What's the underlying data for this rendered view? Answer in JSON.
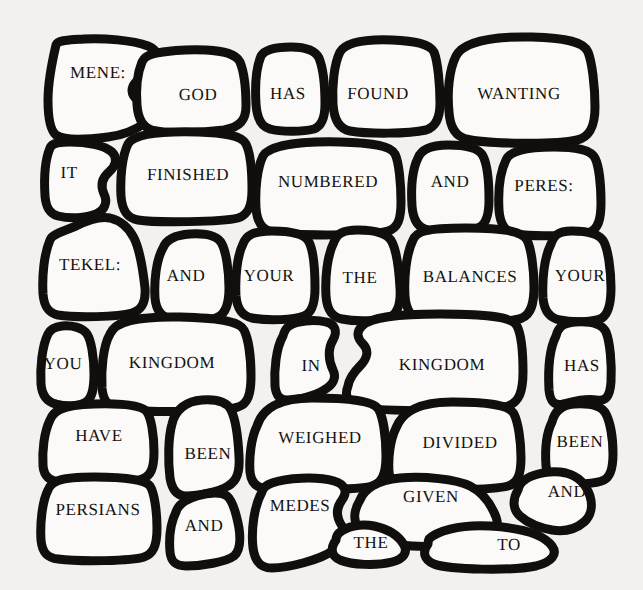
{
  "artwork": {
    "title": "Mene Mene Tekel Upharsin",
    "style": "hand-drawn crazy-paving stone wall",
    "background_color": "#f2f1ef",
    "stone_fill_color": "#fbfaf8",
    "mortar_color": "#100f0d",
    "text_color": "#14120f",
    "cell_count": 34
  },
  "cells": [
    {
      "id": "cell-mene",
      "text": "MENE:",
      "cx": 98,
      "cy": 72,
      "font_size": 17
    },
    {
      "id": "cell-god",
      "text": "GOD",
      "cx": 198,
      "cy": 94,
      "font_size": 17
    },
    {
      "id": "cell-has-1",
      "text": "HAS",
      "cx": 288,
      "cy": 93,
      "font_size": 17
    },
    {
      "id": "cell-found",
      "text": "FOUND",
      "cx": 378,
      "cy": 93,
      "font_size": 17
    },
    {
      "id": "cell-wanting",
      "text": "WANTING",
      "cx": 519,
      "cy": 93,
      "font_size": 17
    },
    {
      "id": "cell-it",
      "text": "IT",
      "cx": 69,
      "cy": 172,
      "font_size": 17
    },
    {
      "id": "cell-finished",
      "text": "FINISHED",
      "cx": 188,
      "cy": 174,
      "font_size": 17
    },
    {
      "id": "cell-numbered",
      "text": "NUMBERED",
      "cx": 328,
      "cy": 181,
      "font_size": 17
    },
    {
      "id": "cell-and-1",
      "text": "AND",
      "cx": 450,
      "cy": 181,
      "font_size": 17
    },
    {
      "id": "cell-peres",
      "text": "PERES:",
      "cx": 544,
      "cy": 185,
      "font_size": 17
    },
    {
      "id": "cell-tekel",
      "text": "TEKEL:",
      "cx": 90,
      "cy": 264,
      "font_size": 17
    },
    {
      "id": "cell-and-2",
      "text": "AND",
      "cx": 186,
      "cy": 275,
      "font_size": 17
    },
    {
      "id": "cell-your-1",
      "text": "YOUR",
      "cx": 269,
      "cy": 275,
      "font_size": 17
    },
    {
      "id": "cell-the-1",
      "text": "THE",
      "cx": 360,
      "cy": 277,
      "font_size": 17
    },
    {
      "id": "cell-balances",
      "text": "BALANCES",
      "cx": 470,
      "cy": 276,
      "font_size": 17
    },
    {
      "id": "cell-your-2",
      "text": "YOUR",
      "cx": 580,
      "cy": 275,
      "font_size": 17
    },
    {
      "id": "cell-you",
      "text": "YOU",
      "cx": 63,
      "cy": 363,
      "font_size": 17
    },
    {
      "id": "cell-kingdom-1",
      "text": "KINGDOM",
      "cx": 172,
      "cy": 362,
      "font_size": 17
    },
    {
      "id": "cell-in",
      "text": "IN",
      "cx": 311,
      "cy": 365,
      "font_size": 17
    },
    {
      "id": "cell-kingdom-2",
      "text": "KINGDOM",
      "cx": 442,
      "cy": 364,
      "font_size": 17
    },
    {
      "id": "cell-has-2",
      "text": "HAS",
      "cx": 582,
      "cy": 365,
      "font_size": 17
    },
    {
      "id": "cell-have",
      "text": "HAVE",
      "cx": 99,
      "cy": 435,
      "font_size": 17
    },
    {
      "id": "cell-been-1",
      "text": "BEEN",
      "cx": 208,
      "cy": 453,
      "font_size": 17
    },
    {
      "id": "cell-weighed",
      "text": "WEIGHED",
      "cx": 320,
      "cy": 437,
      "font_size": 17
    },
    {
      "id": "cell-divided",
      "text": "DIVIDED",
      "cx": 460,
      "cy": 442,
      "font_size": 17
    },
    {
      "id": "cell-been-2",
      "text": "BEEN",
      "cx": 580,
      "cy": 441,
      "font_size": 17
    },
    {
      "id": "cell-persians",
      "text": "PERSIANS",
      "cx": 98,
      "cy": 509,
      "font_size": 17
    },
    {
      "id": "cell-and-3",
      "text": "AND",
      "cx": 204,
      "cy": 525,
      "font_size": 17
    },
    {
      "id": "cell-medes",
      "text": "MEDES",
      "cx": 300,
      "cy": 505,
      "font_size": 17
    },
    {
      "id": "cell-given",
      "text": "GIVEN",
      "cx": 431,
      "cy": 496,
      "font_size": 17
    },
    {
      "id": "cell-and-4",
      "text": "AND",
      "cx": 567,
      "cy": 491,
      "font_size": 17
    },
    {
      "id": "cell-the-2",
      "text": "THE",
      "cx": 371,
      "cy": 542,
      "font_size": 17
    },
    {
      "id": "cell-to",
      "text": "TO",
      "cx": 509,
      "cy": 544,
      "font_size": 17
    }
  ],
  "puzzle_text": {
    "line_1": "MENE: GOD HAS NUMBERED THE DAYS OF YOUR KINGDOM AND FINISHED IT",
    "line_2": "TEKEL: YOU HAVE BEEN WEIGHED IN THE BALANCES AND FOUND WANTING",
    "line_3": "PERES: YOUR KINGDOM HAS BEEN DIVIDED AND GIVEN TO THE MEDES AND PERSIANS"
  }
}
